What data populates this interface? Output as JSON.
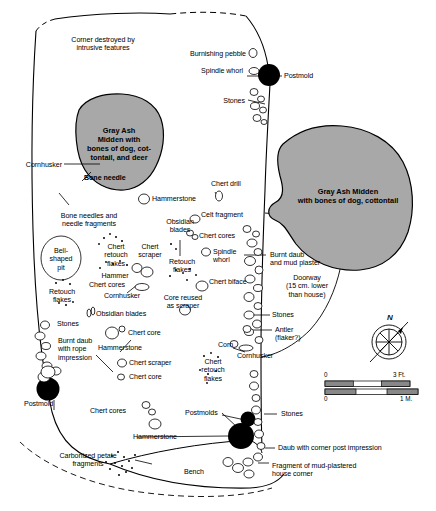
{
  "figure": {
    "kind": "archaeological-house-floor-plan",
    "colors": {
      "midden_fill": "#a8a8a8",
      "midden_stroke": "#000000",
      "postmold_fill": "#000000",
      "outline": "#000000",
      "background": "#ffffff"
    }
  },
  "middens": [
    {
      "id": "midden-left",
      "label": "Gray Ash\nMidden with\nbones of dog, cot-\ntontail, and deer",
      "label_x": 119,
      "label_y": 126
    },
    {
      "id": "midden-right",
      "label": "Gray Ash Midden\nwith bones of dog, cottontail",
      "label_x": 348,
      "label_y": 187
    }
  ],
  "annotations": [
    {
      "id": "corner-destroyed",
      "text": "Corner destroyed by\nintrusive features",
      "x": 103,
      "y": 36,
      "align": "c"
    },
    {
      "id": "burnishing-pebble",
      "text": "Burnishing pebble",
      "x": 246,
      "y": 54,
      "align": "r"
    },
    {
      "id": "spindle-whorl-top",
      "text": "Spindle whorl",
      "x": 243,
      "y": 70,
      "align": "r"
    },
    {
      "id": "postmold-top",
      "text": "Postmold",
      "x": 288,
      "y": 76,
      "align": "l"
    },
    {
      "id": "stones-top",
      "text": "Stones",
      "x": 245,
      "y": 101,
      "align": "r"
    },
    {
      "id": "cornhusker-left",
      "text": "Cornhusker",
      "x": 62,
      "y": 165,
      "align": "r"
    },
    {
      "id": "bone-needle",
      "text": "Bone needle",
      "x": 83,
      "y": 178,
      "align": "l"
    },
    {
      "id": "hammerstone-upper",
      "text": "Hammerstone",
      "x": 152,
      "y": 199,
      "align": "l"
    },
    {
      "id": "chert-drill",
      "text": "Chert drill",
      "x": 213,
      "y": 184,
      "align": "l"
    },
    {
      "id": "celt-fragment",
      "text": "Celt fragment",
      "x": 201,
      "y": 215,
      "align": "l"
    },
    {
      "id": "bone-needles",
      "text": "Bone needles and\nneedle fragments",
      "x": 89,
      "y": 216,
      "align": "c"
    },
    {
      "id": "obsidian-blades-up",
      "text": "Obsidian\nblades",
      "x": 180,
      "y": 222,
      "align": "c"
    },
    {
      "id": "chert-cores-right",
      "text": "Chert cores",
      "x": 199,
      "y": 236,
      "align": "l"
    },
    {
      "id": "bell-shaped-pit",
      "text": "Bell-\nshaped\npit",
      "x": 61,
      "y": 257,
      "align": "c"
    },
    {
      "id": "chert-retouch-fl",
      "text": "Chert\nretouch\nflakes",
      "x": 116,
      "y": 246,
      "align": "c"
    },
    {
      "id": "chert-scraper-mid",
      "text": "Chert\nscraper",
      "x": 148,
      "y": 246,
      "align": "c"
    },
    {
      "id": "spindle-whorl-mid",
      "text": "Spindle\nwhorl",
      "x": 215,
      "y": 251,
      "align": "l"
    },
    {
      "id": "retouch-flakes-mid",
      "text": "Retouch\nflakes",
      "x": 180,
      "y": 262,
      "align": "c"
    },
    {
      "id": "hammer",
      "text": "Hammer",
      "x": 115,
      "y": 275,
      "align": "c"
    },
    {
      "id": "chert-cores-mid",
      "text": "Chert cores",
      "x": 107,
      "y": 284,
      "align": "c"
    },
    {
      "id": "burnt-daub-plaster",
      "text": "Burnt daub\nand mud plaster",
      "x": 272,
      "y": 255,
      "align": "l"
    },
    {
      "id": "chert-biface",
      "text": "Chert biface",
      "x": 208,
      "y": 281,
      "align": "l"
    },
    {
      "id": "cornhusker-mid",
      "text": "Cornhusker",
      "x": 122,
      "y": 295,
      "align": "c"
    },
    {
      "id": "retouch-flakes-lf",
      "text": "Retouch\nflakes",
      "x": 62,
      "y": 292,
      "align": "c"
    },
    {
      "id": "obsidian-blades-lo",
      "text": "Obsidian blades",
      "x": 95,
      "y": 314,
      "align": "l"
    },
    {
      "id": "doorway",
      "text": "Doorway\n(15 cm. lower\nthan house)",
      "x": 307,
      "y": 283,
      "align": "c"
    },
    {
      "id": "core-reused",
      "text": "Core reused\nas scraper",
      "x": 181,
      "y": 297,
      "align": "c"
    },
    {
      "id": "stones-left",
      "text": "Stones",
      "x": 62,
      "y": 324,
      "align": "l"
    },
    {
      "id": "stones-door",
      "text": "Stones",
      "x": 274,
      "y": 315,
      "align": "l"
    },
    {
      "id": "chert-core-upper",
      "text": "Chert core",
      "x": 127,
      "y": 333,
      "align": "l"
    },
    {
      "id": "hammerstone-mid",
      "text": "Hammerstone",
      "x": 118,
      "y": 347,
      "align": "c"
    },
    {
      "id": "antler-flaker",
      "text": "Antler\n(flaker?)",
      "x": 277,
      "y": 330,
      "align": "l"
    },
    {
      "id": "corn",
      "text": "Corn",
      "x": 221,
      "y": 345,
      "align": "l"
    },
    {
      "id": "cornhusker-lower",
      "text": "Cornhusker",
      "x": 237,
      "y": 355,
      "align": "l"
    },
    {
      "id": "burnt-daub-rope",
      "text": "Burnt daub\nwith rope\nimpression",
      "x": 60,
      "y": 340,
      "align": "l"
    },
    {
      "id": "chert-scraper-low",
      "text": "Chert scraper",
      "x": 128,
      "y": 363,
      "align": "l"
    },
    {
      "id": "chert-core-lower",
      "text": "Chert core",
      "x": 128,
      "y": 377,
      "align": "l"
    },
    {
      "id": "chert-retouch-low",
      "text": "Chert\nretouch\nflakes",
      "x": 211,
      "y": 363,
      "align": "c"
    },
    {
      "id": "postmold-left",
      "text": "Postmold",
      "x": 24,
      "y": 404,
      "align": "l"
    },
    {
      "id": "chert-cores-bottom",
      "text": "Chert cores",
      "x": 90,
      "y": 411,
      "align": "l"
    },
    {
      "id": "postmolds",
      "text": "Postmolds",
      "x": 192,
      "y": 413,
      "align": "l"
    },
    {
      "id": "stones-bottom",
      "text": "Stones",
      "x": 281,
      "y": 414,
      "align": "l"
    },
    {
      "id": "hammerstone-bot",
      "text": "Hammerstone",
      "x": 133,
      "y": 437,
      "align": "l"
    },
    {
      "id": "daub-corner-post",
      "text": "Daub with corner post impression",
      "x": 278,
      "y": 448,
      "align": "l"
    },
    {
      "id": "carbonized-petate",
      "text": "Carbonized petate\nfragments",
      "x": 88,
      "y": 456,
      "align": "c"
    },
    {
      "id": "bench",
      "text": "Bench",
      "x": 184,
      "y": 472,
      "align": "l"
    },
    {
      "id": "fragment-mud",
      "text": "Fragment of mud-plastered\nhouse corner",
      "x": 272,
      "y": 466,
      "align": "l"
    }
  ],
  "compass": {
    "label": "N",
    "x": 387,
    "y": 313
  },
  "scale": {
    "feet": {
      "min": "0",
      "max": "3 Ft."
    },
    "meters": {
      "min": "0",
      "max": "1 M."
    }
  }
}
